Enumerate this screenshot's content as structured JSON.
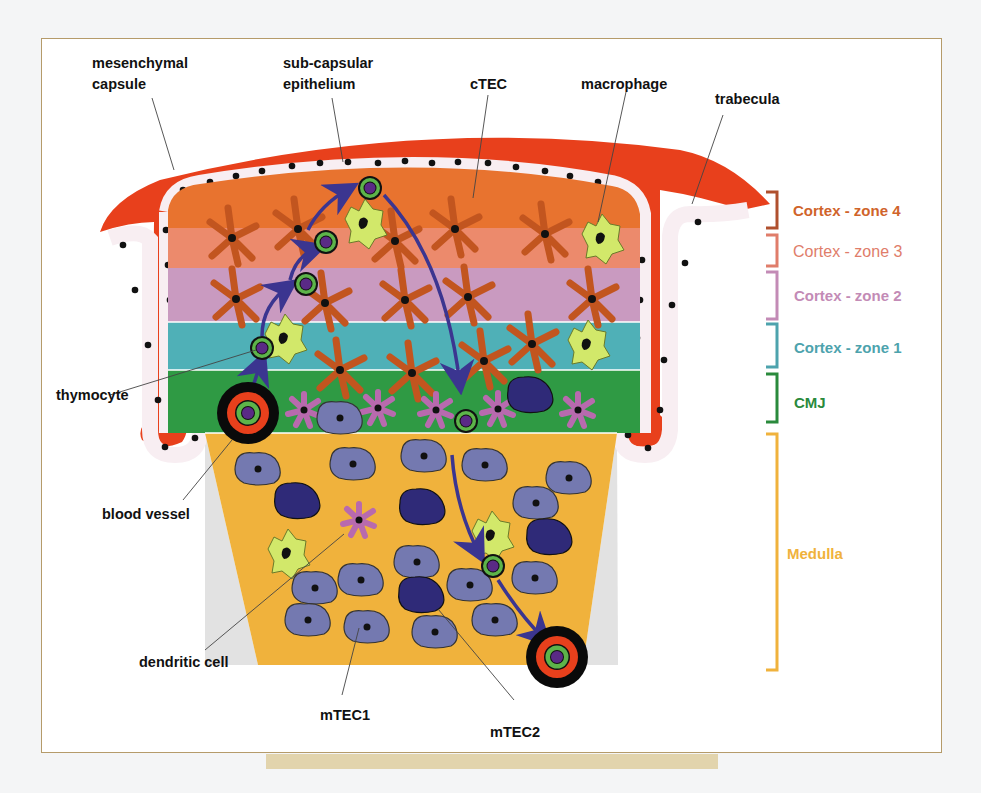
{
  "figure": {
    "callout_labels": {
      "mesenchymal_capsule": [
        "mesenchymal",
        "capsule"
      ],
      "subcapsular_epithelium": [
        "sub-capsular",
        "epithelium"
      ],
      "ctec": "cTEC",
      "macrophage": "macrophage",
      "trabecula": "trabecula",
      "thymocyte": "thymocyte",
      "blood_vessel": "blood vessel",
      "dendritic_cell": "dendritic cell",
      "mtec1": "mTEC1",
      "mtec2": "mTEC2"
    },
    "zones": [
      {
        "id": "zone4",
        "label": "Cortex - zone 4",
        "color": "#e8732f",
        "bracket_color": "#b0502e",
        "text_color": "#d0642a"
      },
      {
        "id": "zone3",
        "label": "Cortex - zone 3",
        "color": "#ec8a6c",
        "bracket_color": "#e07d6a",
        "text_color": "#e07d6a"
      },
      {
        "id": "zone2",
        "label": "Cortex - zone 2",
        "color": "#c99ac0",
        "bracket_color": "#c38bb6",
        "text_color": "#c38bb6"
      },
      {
        "id": "zone1",
        "label": "Cortex - zone 1",
        "color": "#4fb0b7",
        "bracket_color": "#4da3ad",
        "text_color": "#4da3ad"
      },
      {
        "id": "cmj",
        "label": "CMJ",
        "color": "#2f9a44",
        "bracket_color": "#2a8a3c",
        "text_color": "#2a8a3c"
      },
      {
        "id": "medulla",
        "label": "Medulla",
        "color": "#f0b23c",
        "bracket_color": "#f0b23c",
        "text_color": "#f0b23c"
      }
    ],
    "colors": {
      "capsule": "#e8401c",
      "epithelium_fill": "#f8eef2",
      "ctec": "#c2551f",
      "macrophage": "#d2e86a",
      "dendritic": "#b86aae",
      "mtec1": "#7479b0",
      "mtec2": "#2f2a78",
      "thymocyte_ring": "#5db44a",
      "thymocyte_core": "#5a2a86",
      "arrow": "#3b3590",
      "vessel_outer": "#0a0a0a",
      "vessel_mid": "#e8401c",
      "gray_strip": "#e2e2e2"
    }
  }
}
